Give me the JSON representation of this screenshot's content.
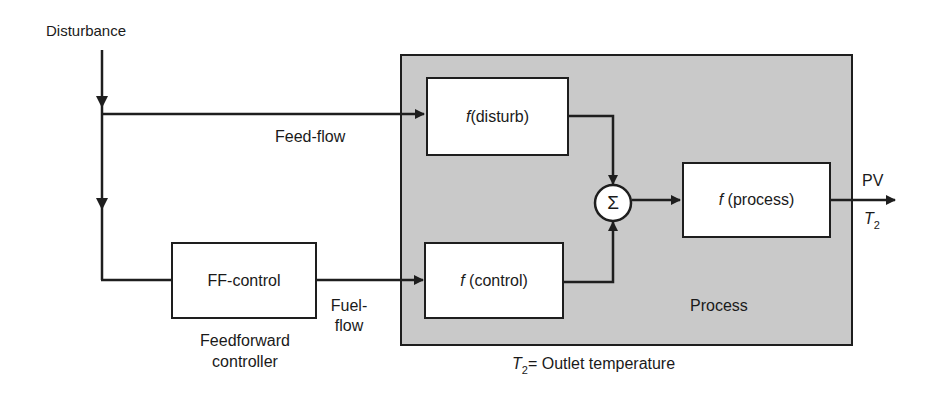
{
  "diagram": {
    "type": "feedforward-control-block-diagram",
    "labels": {
      "disturbance": "Disturbance",
      "feed_flow": "Feed-flow",
      "fuel_flow_line1": "Fuel-",
      "fuel_flow_line2": "flow",
      "ff_caption_line1": "Feedforward",
      "ff_caption_line2": "controller",
      "process": "Process",
      "pv": "PV",
      "t2_symbol": "T",
      "t2_subscript": "2",
      "outlet_caption_eq": "= Outlet temperature"
    },
    "blocks": {
      "ff_control": {
        "label": "FF-control"
      },
      "f_disturb": {
        "func": "f",
        "arg": "(disturb)"
      },
      "f_control": {
        "func": "f",
        "arg": " (control)"
      },
      "f_process": {
        "func": "f",
        "arg": " (process)"
      },
      "summer": {
        "symbol": "Σ"
      }
    },
    "colors": {
      "line": "#1e1e1e",
      "process_fill": "#c9c9c9",
      "block_fill": "#ffffff"
    }
  }
}
